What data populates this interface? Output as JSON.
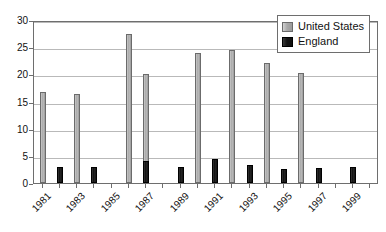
{
  "chart_data": {
    "type": "bar",
    "title": "",
    "subtitle": "",
    "xlabel": "",
    "ylabel": "",
    "ylim": [
      0,
      30
    ],
    "ytick_labels": [
      "0",
      "5",
      "10",
      "15",
      "20",
      "25",
      "30"
    ],
    "ytick_values": [
      0,
      5,
      10,
      15,
      20,
      25,
      30
    ],
    "grid": true,
    "legend_position": "top-right",
    "categories": [
      "1981",
      "1982",
      "1983",
      "1984",
      "1985",
      "1986",
      "1987",
      "1988",
      "1989",
      "1990",
      "1991",
      "1992",
      "1993",
      "1994",
      "1995",
      "1996",
      "1997",
      "1998",
      "1999",
      "2000"
    ],
    "xtick_labels": [
      "1981",
      "1983",
      "1985",
      "1987",
      "1989",
      "1991",
      "1993",
      "1995",
      "1997",
      "1999"
    ],
    "xtick_label_rotation": -45,
    "series": [
      {
        "name": "United States",
        "color": "#a9a9a9",
        "values": [
          16.8,
          0,
          16.4,
          0,
          0,
          27.5,
          20.0,
          0,
          0,
          24.0,
          0,
          24.4,
          0,
          22.0,
          0,
          20.2,
          0,
          0,
          0,
          0
        ]
      },
      {
        "name": "England",
        "color": "#141414",
        "values": [
          0,
          3.0,
          0,
          3.0,
          0,
          0,
          4.1,
          0,
          3.0,
          0,
          4.5,
          0,
          3.4,
          0,
          2.6,
          0,
          2.8,
          0,
          3.0,
          0
        ]
      }
    ]
  },
  "legend": {
    "items": [
      {
        "label": "United States",
        "swatch": "us"
      },
      {
        "label": "England",
        "swatch": "en"
      }
    ]
  }
}
